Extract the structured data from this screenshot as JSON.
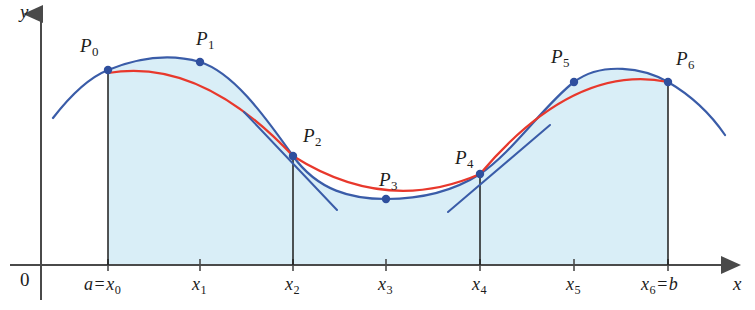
{
  "figure": {
    "width": 755,
    "height": 310,
    "background": "#ffffff"
  },
  "axes": {
    "x_axis_label": "x",
    "y_axis_label": "y",
    "origin_label": "0",
    "x_axis_y_px": 265,
    "y_axis_x_px": 41,
    "axis_color": "#4a4a4a"
  },
  "colors": {
    "curve_blue": "#3a5ca8",
    "parabola_red": "#e8382c",
    "region_fill": "#d9eef7",
    "point_fill": "#2f4f9e",
    "axis": "#4a4a4a",
    "ordinate_line": "#1c1c1c",
    "text": "#1c1c1c"
  },
  "x_ticks": [
    {
      "name": "x0",
      "label_html": "a = x<sub>0</sub>",
      "label_text": "a = x0",
      "x_px": 108,
      "label_x_px": 84,
      "label_y_px": 275
    },
    {
      "name": "x1",
      "label_html": "x<sub>1</sub>",
      "label_text": "x1",
      "x_px": 200,
      "label_x_px": 192,
      "label_y_px": 275
    },
    {
      "name": "x2",
      "label_html": "x<sub>2</sub>",
      "label_text": "x2",
      "x_px": 293,
      "label_x_px": 285,
      "label_y_px": 275
    },
    {
      "name": "x3",
      "label_html": "x<sub>3</sub>",
      "label_text": "x3",
      "x_px": 386,
      "label_x_px": 378,
      "label_y_px": 275
    },
    {
      "name": "x4",
      "label_html": "x<sub>4</sub>",
      "label_text": "x4",
      "x_px": 480,
      "label_x_px": 472,
      "label_y_px": 275
    },
    {
      "name": "x5",
      "label_html": "x<sub>5</sub>",
      "label_text": "x5",
      "x_px": 574,
      "label_x_px": 566,
      "label_y_px": 275
    },
    {
      "name": "x6",
      "label_html": "x<sub>6</sub> = b",
      "label_text": "x6 = b",
      "x_px": 668,
      "label_x_px": 641,
      "label_y_px": 275
    }
  ],
  "points": [
    {
      "name": "P0",
      "label_text": "P0",
      "x_px": 108,
      "y_px": 70,
      "label_x_px": 80,
      "label_y_px": 36
    },
    {
      "name": "P1",
      "label_text": "P1",
      "x_px": 200,
      "y_px": 62,
      "label_x_px": 196,
      "label_y_px": 29
    },
    {
      "name": "P2",
      "label_text": "P2",
      "x_px": 293,
      "y_px": 156,
      "label_x_px": 303,
      "label_y_px": 126
    },
    {
      "name": "P3",
      "label_text": "P3",
      "x_px": 386,
      "y_px": 199,
      "label_x_px": 379,
      "label_y_px": 170
    },
    {
      "name": "P4",
      "label_text": "P4",
      "x_px": 480,
      "y_px": 174,
      "label_x_px": 455,
      "label_y_px": 148
    },
    {
      "name": "P5",
      "label_text": "P5",
      "x_px": 574,
      "y_px": 82,
      "label_x_px": 551,
      "label_y_px": 47
    },
    {
      "name": "P6",
      "label_text": "P6",
      "x_px": 668,
      "y_px": 82,
      "label_x_px": 676,
      "label_y_px": 49
    }
  ],
  "chart_data": {
    "type": "line",
    "xlabel": "x",
    "ylabel": "y",
    "xlim_px": [
      41,
      745
    ],
    "ylim_px": [
      265,
      10
    ],
    "grid": false,
    "legend": "none",
    "series": [
      {
        "name": "f(x) curve",
        "color": "#3a5ca8",
        "style": "solid",
        "path": "M 53 118 C 70 96 88 78 108 70 C 140 57 172 54 200 62 C 232 72 262 112 293 156 C 318 191 352 199 386 199 C 420 199 452 192 480 174 C 512 153 545 104 574 82 C 602 61 644 68 668 82 C 692 96 712 116 725 135"
      },
      {
        "name": "parabolic arc P0-P1-P2",
        "color": "#e8382c",
        "style": "solid",
        "path": "M 108 73 Q 200 57 293 156"
      },
      {
        "name": "parabolic arc P2-P3-P4",
        "color": "#e8382c",
        "style": "solid",
        "path": "M 293 156 Q 386 215 480 174"
      },
      {
        "name": "parabolic arc P4-P5-P6",
        "color": "#e8382c",
        "style": "solid",
        "path": "M 480 174 Q 574 63 668 82"
      },
      {
        "name": "tangent at P2",
        "color": "#3a5ca8",
        "style": "solid",
        "path": "M 244 112 L 337 210"
      },
      {
        "name": "tangent at P4",
        "color": "#3a5ca8",
        "style": "solid",
        "path": "M 448 212 L 550 125"
      }
    ],
    "ordinate_lines": [
      {
        "x_px": 108,
        "y_top_px": 70,
        "y_bottom_px": 265
      },
      {
        "x_px": 293,
        "y_top_px": 156,
        "y_bottom_px": 265
      },
      {
        "x_px": 480,
        "y_px_top": 174,
        "y_top_px": 174,
        "y_bottom_px": 265
      },
      {
        "x_px": 668,
        "y_top_px": 82,
        "y_bottom_px": 265
      }
    ],
    "shaded_region": {
      "label": "area under the curve from a to b",
      "fill": "#d9eef7",
      "path": "M 108 265 L 108 70 C 140 57 172 54 200 62 C 232 72 262 112 293 156 C 318 191 352 199 386 199 C 420 199 452 192 480 174 C 512 153 545 104 574 82 C 602 61 644 68 668 82 L 668 265 Z"
    },
    "annotations": [
      "P0 through P6 mark the sample points at x0..x6",
      "Red curves are the three parabolic arcs, each through three consecutive points",
      "Blue curve is the original function y = f(x)"
    ]
  }
}
